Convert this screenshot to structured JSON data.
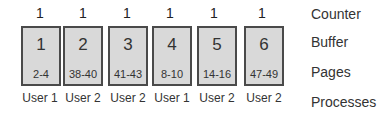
{
  "labels": {
    "counter": "Counter",
    "buffer": "Buffer",
    "pages": "Pages",
    "processes": "Processes"
  },
  "columns": [
    {
      "counter": "1",
      "buffer": "1",
      "pages": "2-4",
      "process": "User 1"
    },
    {
      "counter": "1",
      "buffer": "2",
      "pages": "38-40",
      "process": "User 2"
    },
    {
      "counter": "1",
      "buffer": "3",
      "pages": "41-43",
      "process": "User 2"
    },
    {
      "counter": "1",
      "buffer": "4",
      "pages": "8-10",
      "process": "User 1"
    },
    {
      "counter": "1",
      "buffer": "5",
      "pages": "14-16",
      "process": "User 2"
    },
    {
      "counter": "1",
      "buffer": "6",
      "pages": "47-49",
      "process": "User 2"
    }
  ],
  "colors": {
    "box_fill": "#d9d9d9",
    "box_border": "#4a4a4a"
  }
}
